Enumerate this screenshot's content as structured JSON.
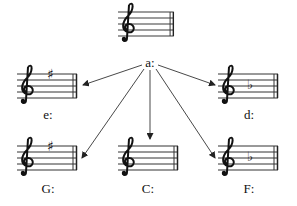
{
  "diagram": {
    "root": {
      "label": "a:",
      "key_signature": "none",
      "accidentals": []
    },
    "targets": [
      {
        "id": "e",
        "label": "e:",
        "key_signature": "1 sharp",
        "accidental": "sharp",
        "position": "middle-left"
      },
      {
        "id": "d",
        "label": "d:",
        "key_signature": "1 flat",
        "accidental": "flat",
        "position": "middle-right"
      },
      {
        "id": "G",
        "label": "G:",
        "key_signature": "1 sharp",
        "accidental": "sharp",
        "position": "bottom-left"
      },
      {
        "id": "C",
        "label": "C:",
        "key_signature": "none",
        "accidental": "none",
        "position": "bottom-center"
      },
      {
        "id": "F",
        "label": "F:",
        "key_signature": "1 flat",
        "accidental": "flat",
        "position": "bottom-right"
      }
    ],
    "accidental_glyphs": {
      "sharp": "♯",
      "flat": "♭"
    },
    "clef_glyph": "𝄞"
  }
}
